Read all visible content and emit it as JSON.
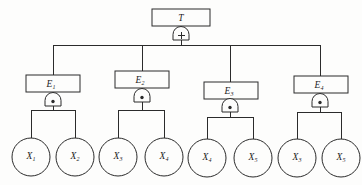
{
  "diagram": {
    "kind": "fault-tree",
    "background_color": "#fdfdfc",
    "line_color": "#2b2b2b",
    "top_event": {
      "id": "T",
      "label": "T",
      "subscript": "",
      "gate": {
        "type": "or",
        "symbol": "+",
        "name": "or-gate"
      }
    },
    "intermediate_events": [
      {
        "id": "E1",
        "label": "E",
        "subscript": "1",
        "gate": {
          "type": "and",
          "symbol": "•",
          "name": "and-gate"
        },
        "children": [
          "X1",
          "X2"
        ]
      },
      {
        "id": "E2",
        "label": "E",
        "subscript": "2",
        "gate": {
          "type": "and",
          "symbol": "•",
          "name": "and-gate"
        },
        "children": [
          "X3",
          "X4"
        ]
      },
      {
        "id": "E3",
        "label": "E",
        "subscript": "3",
        "gate": {
          "type": "and",
          "symbol": "•",
          "name": "and-gate"
        },
        "children": [
          "X4b",
          "X5"
        ]
      },
      {
        "id": "E4",
        "label": "E",
        "subscript": "4",
        "gate": {
          "type": "and",
          "symbol": "•",
          "name": "and-gate"
        },
        "children": [
          "X3b",
          "X5b"
        ]
      }
    ],
    "basic_events": [
      {
        "id": "X1",
        "label": "X",
        "subscript": "1"
      },
      {
        "id": "X2",
        "label": "X",
        "subscript": "2"
      },
      {
        "id": "X3",
        "label": "X",
        "subscript": "3"
      },
      {
        "id": "X4",
        "label": "X",
        "subscript": "4"
      },
      {
        "id": "X4b",
        "label": "X",
        "subscript": "4"
      },
      {
        "id": "X5",
        "label": "X",
        "subscript": "5"
      },
      {
        "id": "X3b",
        "label": "X",
        "subscript": "3"
      },
      {
        "id": "X5b",
        "label": "X",
        "subscript": "5"
      }
    ]
  }
}
